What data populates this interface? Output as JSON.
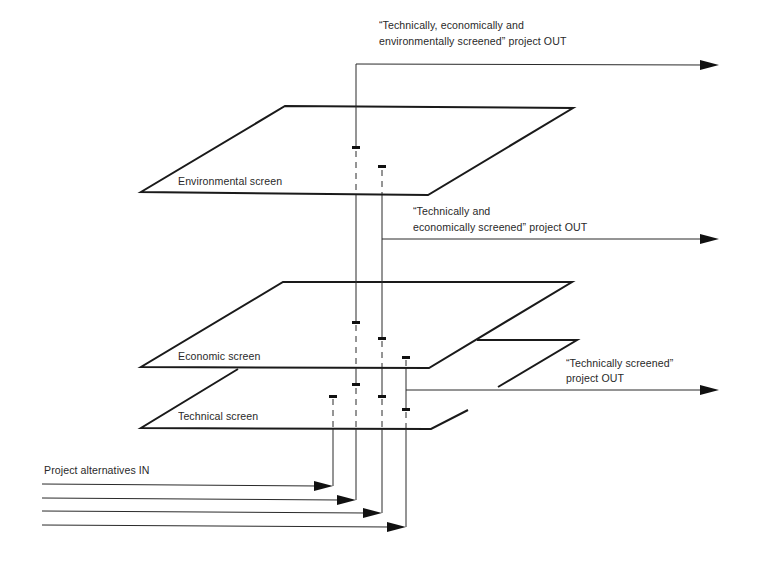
{
  "diagram": {
    "type": "layered-screening-process",
    "screens": [
      {
        "id": "environmental",
        "label": "Environmental screen"
      },
      {
        "id": "economic",
        "label": "Economic screen"
      },
      {
        "id": "technical",
        "label": "Technical screen"
      }
    ],
    "inputs": {
      "label": "Project alternatives IN",
      "count": 4
    },
    "outputs": [
      {
        "id": "env-out",
        "line1": "“Technically, economically and",
        "line2": "environmentally screened” project OUT"
      },
      {
        "id": "econ-out",
        "line1": "“Technically and",
        "line2": "economically screened” project OUT"
      },
      {
        "id": "tech-out",
        "line1": "“Technically screened”",
        "line2": "project OUT"
      }
    ]
  }
}
